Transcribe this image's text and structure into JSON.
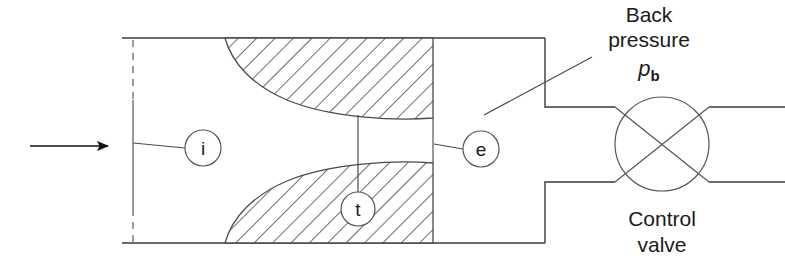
{
  "figure": {
    "flow_arrow": "flow-direction-arrow"
  },
  "station_labels": {
    "inlet": "i",
    "throat": "t",
    "exit": "e"
  },
  "annotations": {
    "back_pressure_line1": "Back",
    "back_pressure_line2": "pressure",
    "back_pressure_symbol": "p",
    "back_pressure_subscript": "b",
    "control_valve_line1": "Control",
    "control_valve_line2": "valve"
  },
  "colors": {
    "stroke": "#3a3a3a",
    "thin_stroke": "#555555",
    "text": "#1a1a1a",
    "background": "#ffffff"
  },
  "geometry": {
    "duct_left_x": 122,
    "duct_right_x": 433,
    "duct_top_y": 38,
    "duct_bottom_y": 243,
    "plenum_right_x": 545,
    "pipe_top_y": 107,
    "pipe_bottom_y": 182,
    "valve_center_x": 662,
    "valve_center_y": 144,
    "valve_radius": 47,
    "throat_x": 358,
    "inlet_dash_x": 133
  }
}
